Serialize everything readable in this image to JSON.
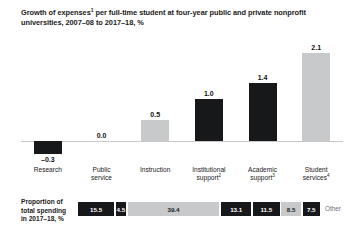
{
  "title": {
    "line1_a": "Growth of expenses",
    "line1_sup": "1",
    "line1_b": " per full-time student at four-year public and private nonprofit universities,",
    "line2": "2007–08 to 2017–18, %"
  },
  "colors": {
    "dark": "#17181a",
    "light": "#c7c9cb",
    "axis": "#c9c9c9",
    "text": "#1a1a1a",
    "muted": "#6d7073",
    "background": "#ffffff"
  },
  "proportion": {
    "label_line1": "Proportion of",
    "label_line2": "total spending",
    "label_line3": "in 2017–18, %",
    "other_label": "Other",
    "segments": [
      {
        "value": "15.5",
        "num": 15.5,
        "tone": "dark"
      },
      {
        "value": "4.5",
        "num": 4.5,
        "tone": "dark"
      },
      {
        "value": "39.4",
        "num": 39.4,
        "tone": "light"
      },
      {
        "value": "13.1",
        "num": 13.1,
        "tone": "dark"
      },
      {
        "value": "11.5",
        "num": 11.5,
        "tone": "dark"
      },
      {
        "value": "8.5",
        "num": 8.5,
        "tone": "light"
      },
      {
        "value": "7.5",
        "num": 7.5,
        "tone": "dark"
      }
    ]
  },
  "chart_data": {
    "type": "bar",
    "title": "Growth of expenses1 per full-time student at four-year public and private nonprofit universities, 2007–08 to 2017–18, %",
    "xlabel": "",
    "ylabel": "",
    "ylim": [
      -0.4,
      2.3
    ],
    "grid": false,
    "legend": "none",
    "categories": [
      "Research",
      "Public service",
      "Instruction",
      "Institutional support2",
      "Academic support3",
      "Student services4"
    ],
    "category_lines": [
      [
        "Research",
        ""
      ],
      [
        "Public",
        "service"
      ],
      [
        "Instruction",
        ""
      ],
      [
        "Institutional",
        "support"
      ],
      [
        "Academic",
        "support"
      ],
      [
        "Student",
        "services"
      ]
    ],
    "category_sups": [
      "",
      "",
      "",
      "2",
      "3",
      "4"
    ],
    "values": [
      -0.3,
      0.0,
      0.5,
      1.0,
      1.4,
      2.1
    ],
    "value_labels": [
      "–0.3",
      "0.0",
      "0.5",
      "1.0",
      "1.4",
      "2.1"
    ],
    "bar_tones": [
      "dark",
      "none",
      "light",
      "dark",
      "dark",
      "light"
    ]
  }
}
